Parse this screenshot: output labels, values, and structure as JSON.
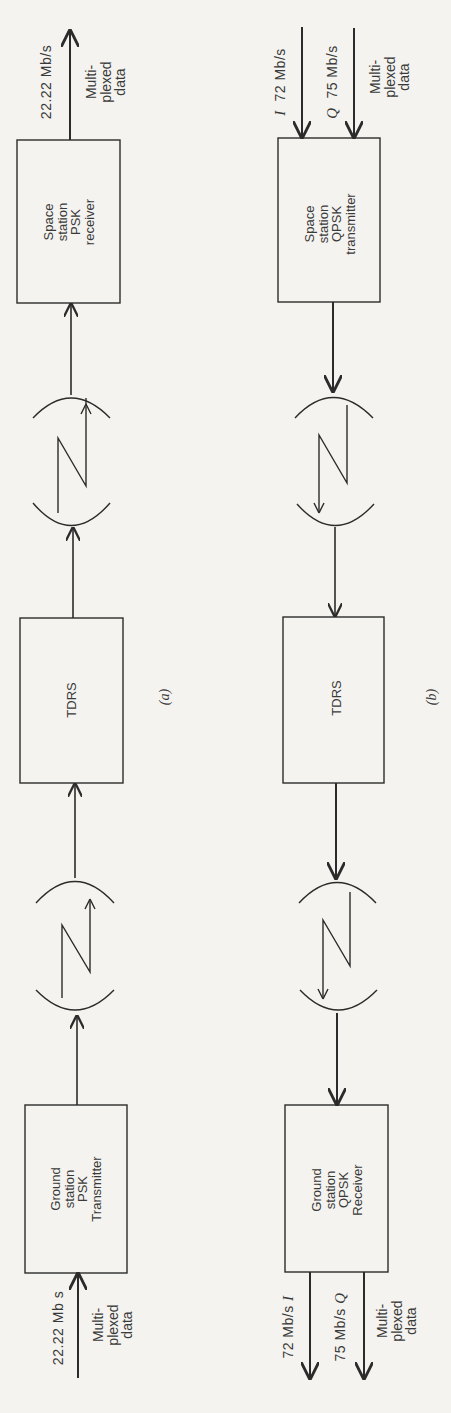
{
  "figure": {
    "orientation": "rotated -90deg (text reads bottom-to-top)",
    "stroke_color": "#2b2b2b",
    "background_color": "#f4f3ef"
  },
  "diagram_a": {
    "caption": "(a)",
    "input": {
      "rate": "22.22 Mb s",
      "label_lines": [
        "Multi-",
        "plexed",
        "data"
      ]
    },
    "blocks": [
      {
        "id": "ground-tx",
        "lines": [
          "Ground",
          "station",
          "PSK",
          "Transmitter"
        ]
      },
      {
        "id": "tdrs",
        "lines": [
          "TDRS"
        ]
      },
      {
        "id": "space-rx",
        "lines": [
          "Space",
          "station",
          "PSK",
          "receiver"
        ]
      }
    ],
    "output": {
      "rate": "22.22 Mb/s",
      "label_lines": [
        "Multi-",
        "plexed",
        "data"
      ]
    },
    "links": [
      "ground-tx -> antenna -> tdrs",
      "tdrs -> antenna -> space-rx"
    ]
  },
  "diagram_b": {
    "caption": "(b)",
    "inputs": [
      {
        "channel": "I",
        "rate": "72 Mb/s"
      },
      {
        "channel": "Q",
        "rate": "75 Mb/s"
      }
    ],
    "input_mux_lines": [
      "Multi-",
      "plexed",
      "data"
    ],
    "blocks": [
      {
        "id": "space-tx",
        "lines": [
          "Space",
          "station",
          "QPSK",
          "transmitter"
        ]
      },
      {
        "id": "tdrs",
        "lines": [
          "TDRS"
        ]
      },
      {
        "id": "ground-rx",
        "lines": [
          "Ground",
          "station",
          "QPSK",
          "Receiver"
        ]
      }
    ],
    "outputs": [
      {
        "channel": "I",
        "rate": "72 Mb/s"
      },
      {
        "channel": "Q",
        "rate": "75 Mb/s"
      }
    ],
    "output_mux_lines": [
      "Multi-",
      "plexed",
      "data"
    ],
    "links": [
      "space-tx -> antenna -> tdrs",
      "tdrs -> antenna -> ground-rx"
    ]
  }
}
